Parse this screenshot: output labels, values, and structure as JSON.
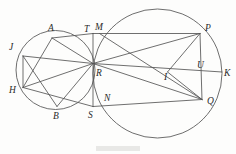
{
  "figure": {
    "background_color": "#fdfdfc",
    "stroke_color": "#555555",
    "label_color": "#2a2a2a",
    "width": 236,
    "height": 154,
    "circles": [
      {
        "name": "small-circle",
        "cx": 55.5,
        "cy": 70.0,
        "r": 39.5
      },
      {
        "name": "large-circle",
        "cx": 157.5,
        "cy": 73.5,
        "r": 64.5
      }
    ],
    "points": [
      {
        "id": "A",
        "label": "A",
        "x": 52.0,
        "y": 38.0,
        "lx": 48.0,
        "ly": 31.0
      },
      {
        "id": "B",
        "label": "B",
        "x": 57.0,
        "y": 106.5,
        "lx": 53.0,
        "ly": 119.0
      },
      {
        "id": "H",
        "label": "H",
        "x": 23.0,
        "y": 87.5,
        "lx": 9.0,
        "ly": 93.0
      },
      {
        "id": "J",
        "label": "J",
        "x": 23.0,
        "y": 56.0,
        "lx": 9.0,
        "ly": 50.0
      },
      {
        "id": "T",
        "label": "T",
        "x": 93.0,
        "y": 33.5,
        "lx": 84.0,
        "ly": 32.0
      },
      {
        "id": "M",
        "label": "M",
        "x": 99.5,
        "y": 33.5,
        "lx": 95.0,
        "ly": 30.0
      },
      {
        "id": "R",
        "label": "R",
        "x": 93.0,
        "y": 63.5,
        "lx": 96.0,
        "ly": 76.0
      },
      {
        "id": "S",
        "label": "S",
        "x": 93.0,
        "y": 106.5,
        "lx": 88.0,
        "ly": 118.0
      },
      {
        "id": "N",
        "label": "N",
        "x": 107.0,
        "y": 106.5,
        "lx": 104.0,
        "ly": 101.0
      },
      {
        "id": "P",
        "label": "P",
        "x": 200.0,
        "y": 33.5,
        "lx": 205.0,
        "ly": 31.0
      },
      {
        "id": "Q",
        "label": "Q",
        "x": 202.0,
        "y": 99.5,
        "lx": 207.0,
        "ly": 104.0
      },
      {
        "id": "K",
        "label": "K",
        "x": 222.0,
        "y": 72.0,
        "lx": 224.0,
        "ly": 76.0
      },
      {
        "id": "U",
        "label": "U",
        "x": 200.5,
        "y": 72.0,
        "lx": 197.0,
        "ly": 68.0
      },
      {
        "id": "I",
        "label": "I",
        "x": 167.5,
        "y": 72.0,
        "lx": 164.0,
        "ly": 80.0
      }
    ],
    "segments": [
      {
        "name": "A-R",
        "x1": 52.0,
        "y1": 38.0,
        "x2": 93.0,
        "y2": 63.5
      },
      {
        "name": "A-H",
        "x1": 52.0,
        "y1": 38.0,
        "x2": 23.0,
        "y2": 87.5
      },
      {
        "name": "A-T",
        "x1": 52.0,
        "y1": 38.0,
        "x2": 93.0,
        "y2": 33.5
      },
      {
        "name": "T-P",
        "x1": 93.0,
        "y1": 33.5,
        "x2": 200.0,
        "y2": 33.5
      },
      {
        "name": "J-R",
        "x1": 23.0,
        "y1": 56.0,
        "x2": 93.0,
        "y2": 63.5
      },
      {
        "name": "J-B",
        "x1": 23.0,
        "y1": 56.0,
        "x2": 57.0,
        "y2": 106.5
      },
      {
        "name": "J-H",
        "x1": 23.0,
        "y1": 56.0,
        "x2": 23.0,
        "y2": 87.5
      },
      {
        "name": "H-R",
        "x1": 23.0,
        "y1": 87.5,
        "x2": 93.0,
        "y2": 63.5
      },
      {
        "name": "H-S",
        "x1": 23.0,
        "y1": 87.5,
        "x2": 93.0,
        "y2": 106.5
      },
      {
        "name": "B-R",
        "x1": 57.0,
        "y1": 106.5,
        "x2": 93.0,
        "y2": 63.5
      },
      {
        "name": "S-Q",
        "x1": 93.0,
        "y1": 106.5,
        "x2": 202.0,
        "y2": 99.5
      },
      {
        "name": "T-S",
        "x1": 93.0,
        "y1": 33.5,
        "x2": 93.0,
        "y2": 106.5
      },
      {
        "name": "R-K",
        "x1": 93.0,
        "y1": 63.5,
        "x2": 222.0,
        "y2": 72.0
      },
      {
        "name": "R-P",
        "x1": 93.0,
        "y1": 63.5,
        "x2": 200.0,
        "y2": 33.5
      },
      {
        "name": "R-Q",
        "x1": 93.0,
        "y1": 63.5,
        "x2": 202.0,
        "y2": 99.5
      },
      {
        "name": "P-Q",
        "x1": 200.0,
        "y1": 33.5,
        "x2": 202.0,
        "y2": 99.5
      },
      {
        "name": "P-I",
        "x1": 200.0,
        "y1": 33.5,
        "x2": 167.5,
        "y2": 72.0
      },
      {
        "name": "I-Q",
        "x1": 167.5,
        "y1": 72.0,
        "x2": 202.0,
        "y2": 99.5
      },
      {
        "name": "M-Q",
        "x1": 99.5,
        "y1": 33.5,
        "x2": 202.0,
        "y2": 99.5
      }
    ]
  }
}
